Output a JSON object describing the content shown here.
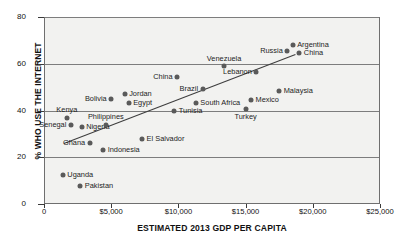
{
  "chart_data": {
    "type": "scatter",
    "title": "",
    "xlabel": "ESTIMATED 2013 GDP PER CAPITA",
    "ylabel": "% WHO USE THE INTERNET",
    "xlim": [
      0,
      25000
    ],
    "ylim": [
      0,
      80
    ],
    "grid": true,
    "legend": "none",
    "xticks": [
      {
        "value": 0,
        "label": "0"
      },
      {
        "value": 5000,
        "label": "$5,000"
      },
      {
        "value": 10000,
        "label": "$10,000"
      },
      {
        "value": 15000,
        "label": "$15,000"
      },
      {
        "value": 20000,
        "label": "$20,000"
      },
      {
        "value": 25000,
        "label": "$25,000"
      }
    ],
    "yticks": [
      {
        "value": 0,
        "label": "0"
      },
      {
        "value": 20,
        "label": "20"
      },
      {
        "value": 40,
        "label": "40"
      },
      {
        "value": 60,
        "label": "60"
      },
      {
        "value": 80,
        "label": "80"
      }
    ],
    "gridlines_y": [
      20,
      40,
      60,
      80
    ],
    "points": [
      {
        "name": "Uganda",
        "x": 1400,
        "y": 12.5,
        "pos": "r"
      },
      {
        "name": "Kenya",
        "x": 1700,
        "y": 37,
        "pos": "a"
      },
      {
        "name": "Senegal",
        "x": 2000,
        "y": 34,
        "pos": "l"
      },
      {
        "name": "Pakistan",
        "x": 2700,
        "y": 7.5,
        "pos": "r"
      },
      {
        "name": "Nigeria",
        "x": 2800,
        "y": 33,
        "pos": "r"
      },
      {
        "name": "Ghana",
        "x": 3400,
        "y": 26,
        "pos": "l"
      },
      {
        "name": "Indonesia",
        "x": 4400,
        "y": 23,
        "pos": "r"
      },
      {
        "name": "Philippines",
        "x": 4600,
        "y": 34,
        "pos": "a"
      },
      {
        "name": "Bolivia",
        "x": 5000,
        "y": 45,
        "pos": "l"
      },
      {
        "name": "Jordan",
        "x": 6000,
        "y": 47,
        "pos": "r"
      },
      {
        "name": "Egypt",
        "x": 6300,
        "y": 43,
        "pos": "r"
      },
      {
        "name": "El Salvador",
        "x": 7300,
        "y": 28,
        "pos": "r"
      },
      {
        "name": "Tunisia",
        "x": 9700,
        "y": 40,
        "pos": "r"
      },
      {
        "name": "China",
        "x": 9900,
        "y": 54.5,
        "pos": "l"
      },
      {
        "name": "South Africa",
        "x": 11300,
        "y": 43,
        "pos": "r"
      },
      {
        "name": "Brazil",
        "x": 11800,
        "y": 49,
        "pos": "l"
      },
      {
        "name": "Venezuela",
        "x": 13400,
        "y": 59,
        "pos": "a"
      },
      {
        "name": "Turkey",
        "x": 15000,
        "y": 40.5,
        "pos": "b"
      },
      {
        "name": "Mexico",
        "x": 15400,
        "y": 44.5,
        "pos": "r"
      },
      {
        "name": "Lebanon",
        "x": 15800,
        "y": 56.5,
        "pos": "l"
      },
      {
        "name": "Malaysia",
        "x": 17500,
        "y": 48.5,
        "pos": "r"
      },
      {
        "name": "Russia",
        "x": 18100,
        "y": 65.5,
        "pos": "l"
      },
      {
        "name": "Argentina",
        "x": 18500,
        "y": 68,
        "pos": "r"
      },
      {
        "name": "China",
        "x": 19000,
        "y": 64.5,
        "pos": "r"
      }
    ],
    "trendline": {
      "x1": 1500,
      "y1": 26,
      "x2": 18700,
      "y2": 64
    }
  },
  "colors": {
    "dot": "#5a5a5a",
    "plot_background": "#f2f2f0",
    "grid": "#7d7d7d",
    "trend": "#3d3d3d",
    "text": "#1a1a1a"
  }
}
